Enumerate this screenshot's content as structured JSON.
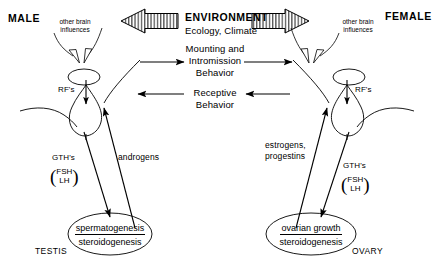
{
  "diagram": {
    "male_label": "MALE",
    "female_label": "FEMALE",
    "environment": {
      "title": "ENVIRONMENT",
      "subtitle": "Ecology,  Climate",
      "left_arrow_icon": "hatched-block-arrow-left-icon",
      "right_arrow_icon": "hatched-block-arrow-right-icon"
    },
    "behaviors": [
      {
        "id": "mounting",
        "line1": "Mounting and",
        "line2": "Intromission",
        "line3": "Behavior",
        "direction": "male-to-female"
      },
      {
        "id": "receptive",
        "line1": "Receptive",
        "line2": "Behavior",
        "direction": "female-to-male"
      }
    ],
    "male": {
      "brain_note_line1": "other brain",
      "brain_note_line2": "influences",
      "rfs_label": "RF's",
      "gth_label": "GTH's",
      "fsh": "FSH",
      "lh": "LH",
      "gonadal_hormone": "androgens",
      "gonad_line1": "spermatogenesis",
      "gonad_line2": "steroidogenesis",
      "gonad_name": "TESTIS"
    },
    "female": {
      "brain_note_line1": "other brain",
      "brain_note_line2": "influences",
      "rfs_label": "RF's",
      "gth_label": "GTH's",
      "fsh": "FSH",
      "lh": "LH",
      "gonadal_hormone_line1": "estrogens,",
      "gonadal_hormone_line2": "progestins",
      "gonad_line1": "ovarian  growth",
      "gonad_line2": "steroidogenesis",
      "gonad_name": "OVARY"
    },
    "colors": {
      "ink": "#000000",
      "background": "#ffffff"
    }
  }
}
